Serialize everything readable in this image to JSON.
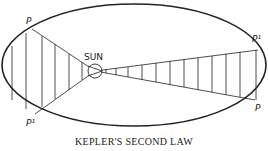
{
  "diagram": {
    "title": "KEPLER'S SECOND LAW",
    "sun_label": "SUN",
    "left_sector": {
      "top_label": "P",
      "bottom_label": "P¹"
    },
    "right_sector": {
      "top_label": "P¹",
      "bottom_label": "P"
    },
    "colors": {
      "stroke": "#222222",
      "background": "#ffffff"
    }
  }
}
